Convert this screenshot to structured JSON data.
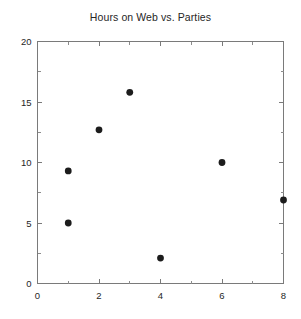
{
  "chart_data": {
    "type": "scatter",
    "title": "Hours on Web vs. Parties",
    "xlabel": "",
    "ylabel": "",
    "xlim": [
      0,
      8
    ],
    "ylim": [
      0,
      20
    ],
    "grid": false,
    "legend": null,
    "x_major_ticks": [
      0,
      2,
      4,
      6,
      8
    ],
    "x_minor_ticks": [
      1,
      3,
      5,
      7
    ],
    "x_tick_labels": [
      "0",
      "2",
      "4",
      "6",
      "8"
    ],
    "y_major_ticks": [
      0,
      5,
      10,
      15,
      20
    ],
    "y_minor_ticks": [
      2.5,
      7.5,
      12.5,
      17.5
    ],
    "y_tick_labels": [
      "0",
      "5",
      "10",
      "15",
      "20"
    ],
    "marker": "circle",
    "marker_color": "#1c1c1c",
    "points": [
      {
        "x": 1,
        "y": 5.0
      },
      {
        "x": 1,
        "y": 9.3
      },
      {
        "x": 2,
        "y": 12.7
      },
      {
        "x": 3,
        "y": 15.8
      },
      {
        "x": 4,
        "y": 2.1
      },
      {
        "x": 6,
        "y": 10.0
      },
      {
        "x": 8,
        "y": 6.9
      }
    ]
  },
  "figure": {
    "background_color": "#ffffff",
    "axis_color": "#7a7a7a",
    "text_color": "#262626"
  }
}
